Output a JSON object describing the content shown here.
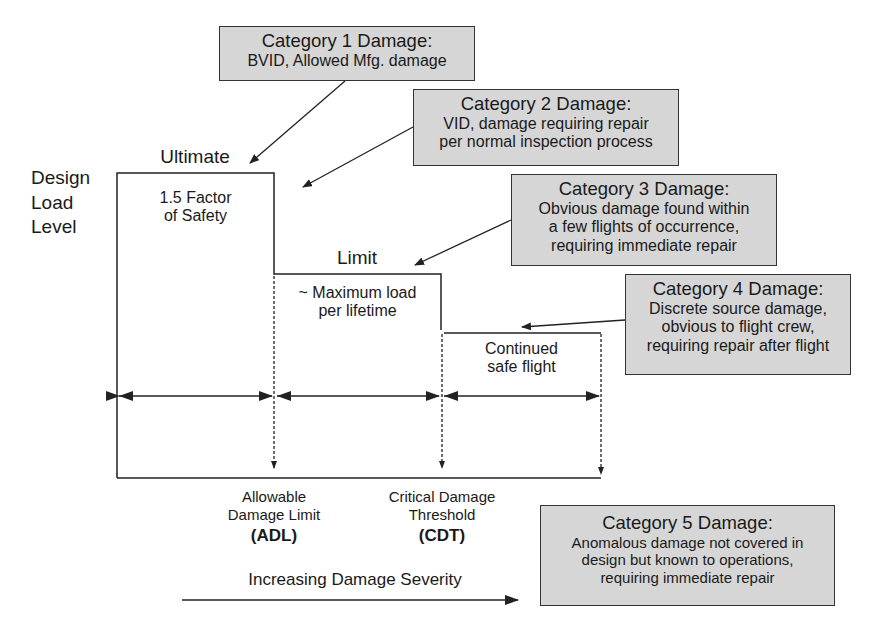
{
  "yaxis": {
    "label_lines": [
      "Design",
      "Load",
      "Level"
    ]
  },
  "levels": {
    "ultimate": {
      "label": "Ultimate",
      "desc_lines": [
        "1.5 Factor",
        "of Safety"
      ]
    },
    "limit": {
      "label": "Limit",
      "desc_lines": [
        "~ Maximum load",
        "per lifetime"
      ]
    },
    "continued": {
      "desc_lines": [
        "Continued",
        "safe flight"
      ]
    }
  },
  "thresholds": {
    "adl": {
      "lines": [
        "Allowable",
        "Damage Limit"
      ],
      "abbr": "(ADL)"
    },
    "cdt": {
      "lines": [
        "Critical Damage",
        "Threshold"
      ],
      "abbr": "(CDT)"
    }
  },
  "severity_axis": {
    "label": "Increasing Damage Severity"
  },
  "categories": [
    {
      "title": "Category 1 Damage:",
      "lines": [
        "BVID, Allowed Mfg. damage"
      ]
    },
    {
      "title": "Category 2 Damage:",
      "lines": [
        "VID, damage requiring repair",
        "per normal inspection process"
      ]
    },
    {
      "title": "Category 3 Damage:",
      "lines": [
        "Obvious damage found within",
        "a few flights of occurrence,",
        "requiring immediate repair"
      ]
    },
    {
      "title": "Category 4 Damage:",
      "lines": [
        "Discrete source damage,",
        "obvious to flight crew,",
        "requiring repair after flight"
      ]
    },
    {
      "title": "Category 5 Damage:",
      "lines": [
        "Anomalous damage not covered in",
        "design but known to operations,",
        "requiring immediate repair"
      ]
    }
  ],
  "colors": {
    "box_fill": "#d6d6d6",
    "line": "#222222",
    "background": "#ffffff"
  }
}
